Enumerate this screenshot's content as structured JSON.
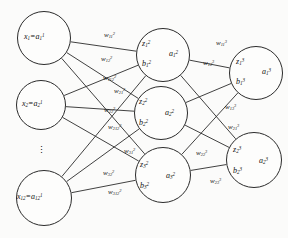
{
  "figure": {
    "stroke_color": "#2b2b2b",
    "text_color": "#111111",
    "background": "#fbfbfa"
  },
  "layers": {
    "input": {
      "name": "input-layer",
      "nodes": [
        {
          "id": "in-1",
          "label": "x₁=a₁¹",
          "base": "x",
          "sub": "1",
          "eq_base": "a",
          "eq_sub": "1",
          "eq_sup": "1",
          "cx": 44,
          "cy": 38,
          "r": 27
        },
        {
          "id": "in-2",
          "label": "x₂=a₂¹",
          "base": "x",
          "sub": "2",
          "eq_base": "a",
          "eq_sub": "2",
          "eq_sup": "1",
          "cx": 41,
          "cy": 105,
          "r": 25
        },
        {
          "id": "in-12",
          "label": "x₁₂=a₁₂¹",
          "base": "x",
          "sub": "12",
          "eq_base": "a",
          "eq_sub": "12",
          "eq_sup": "1",
          "cx": 44,
          "cy": 198,
          "r": 28
        }
      ],
      "ellipsis": "⋮"
    },
    "hidden": {
      "name": "hidden-layer",
      "nodes": [
        {
          "id": "h-1",
          "z": "z",
          "z_sub": "1",
          "z_sup": "2",
          "b": "b",
          "b_sub": "1",
          "b_sup": "2",
          "a": "a",
          "a_sub": "1",
          "a_sup": "2",
          "cx": 163,
          "cy": 55,
          "r": 27
        },
        {
          "id": "h-2",
          "z": "z",
          "z_sub": "2",
          "z_sup": "2",
          "b": "b",
          "b_sub": "2",
          "b_sup": "2",
          "a": "a",
          "a_sub": "2",
          "a_sup": "2",
          "cx": 161,
          "cy": 113,
          "r": 27
        },
        {
          "id": "h-3",
          "z": "z",
          "z_sub": "3",
          "z_sup": "2",
          "b": "b",
          "b_sub": "3",
          "b_sup": "2",
          "a": "a",
          "a_sub": "3",
          "a_sup": "2",
          "cx": 163,
          "cy": 175,
          "r": 28
        }
      ]
    },
    "output": {
      "name": "output-layer",
      "nodes": [
        {
          "id": "o-1",
          "z": "z",
          "z_sub": "1",
          "z_sup": "3",
          "b": "b",
          "b_sub": "1",
          "b_sup": "3",
          "a": "a",
          "a_sub": "1",
          "a_sup": "3",
          "cx": 256,
          "cy": 73,
          "r": 27
        },
        {
          "id": "o-2",
          "z": "z",
          "z_sub": "2",
          "z_sup": "3",
          "b": "b",
          "b_sub": "2",
          "b_sup": "3",
          "a": "a",
          "a_sub": "2",
          "a_sup": "3",
          "cx": 254,
          "cy": 160,
          "r": 28
        }
      ]
    }
  },
  "weights": {
    "layer2": [
      {
        "id": "w-2-11",
        "base": "w",
        "sub": "11",
        "sup": "2",
        "x": 104,
        "y": 32
      },
      {
        "id": "w-2-12",
        "base": "w",
        "sub": "12",
        "sup": "2",
        "x": 101,
        "y": 56
      },
      {
        "id": "w-2-112",
        "base": "w",
        "sub": "112",
        "sup": "2",
        "x": 103,
        "y": 75
      },
      {
        "id": "w-2-21",
        "base": "w",
        "sub": "21",
        "sup": "2",
        "x": 114,
        "y": 88
      },
      {
        "id": "w-2-22",
        "base": "w",
        "sub": "22",
        "sup": "2",
        "x": 104,
        "y": 107
      },
      {
        "id": "w-2-212",
        "base": "w",
        "sub": "212",
        "sup": "2",
        "x": 108,
        "y": 124
      },
      {
        "id": "w-2-31",
        "base": "w",
        "sub": "31",
        "sup": "2",
        "x": 124,
        "y": 148
      },
      {
        "id": "w-2-32",
        "base": "w",
        "sub": "32",
        "sup": "2",
        "x": 103,
        "y": 170
      },
      {
        "id": "w-2-312",
        "base": "w",
        "sub": "312",
        "sup": "2",
        "x": 108,
        "y": 189
      }
    ],
    "layer3": [
      {
        "id": "w-3-11",
        "base": "w",
        "sub": "11",
        "sup": "3",
        "x": 216,
        "y": 40
      },
      {
        "id": "w-3-12",
        "base": "w",
        "sub": "12",
        "sup": "3",
        "x": 203,
        "y": 60
      },
      {
        "id": "w-3-13",
        "base": "w",
        "sub": "13",
        "sup": "3",
        "x": 225,
        "y": 104
      },
      {
        "id": "w-3-21",
        "base": "w",
        "sub": "21",
        "sup": "3",
        "x": 228,
        "y": 124
      },
      {
        "id": "w-3-22",
        "base": "w",
        "sub": "22",
        "sup": "3",
        "x": 196,
        "y": 150
      },
      {
        "id": "w-3-23",
        "base": "w",
        "sub": "23",
        "sup": "3",
        "x": 210,
        "y": 178
      }
    ]
  },
  "edges": {
    "name": "connection-lines",
    "list": [
      {
        "from": "in-1",
        "to": "h-1"
      },
      {
        "from": "in-1",
        "to": "h-2"
      },
      {
        "from": "in-1",
        "to": "h-3"
      },
      {
        "from": "in-2",
        "to": "h-1"
      },
      {
        "from": "in-2",
        "to": "h-2"
      },
      {
        "from": "in-2",
        "to": "h-3"
      },
      {
        "from": "in-12",
        "to": "h-1"
      },
      {
        "from": "in-12",
        "to": "h-2"
      },
      {
        "from": "in-12",
        "to": "h-3"
      },
      {
        "from": "h-1",
        "to": "o-1"
      },
      {
        "from": "h-1",
        "to": "o-2"
      },
      {
        "from": "h-2",
        "to": "o-1"
      },
      {
        "from": "h-2",
        "to": "o-2"
      },
      {
        "from": "h-3",
        "to": "o-1"
      },
      {
        "from": "h-3",
        "to": "o-2"
      }
    ]
  }
}
